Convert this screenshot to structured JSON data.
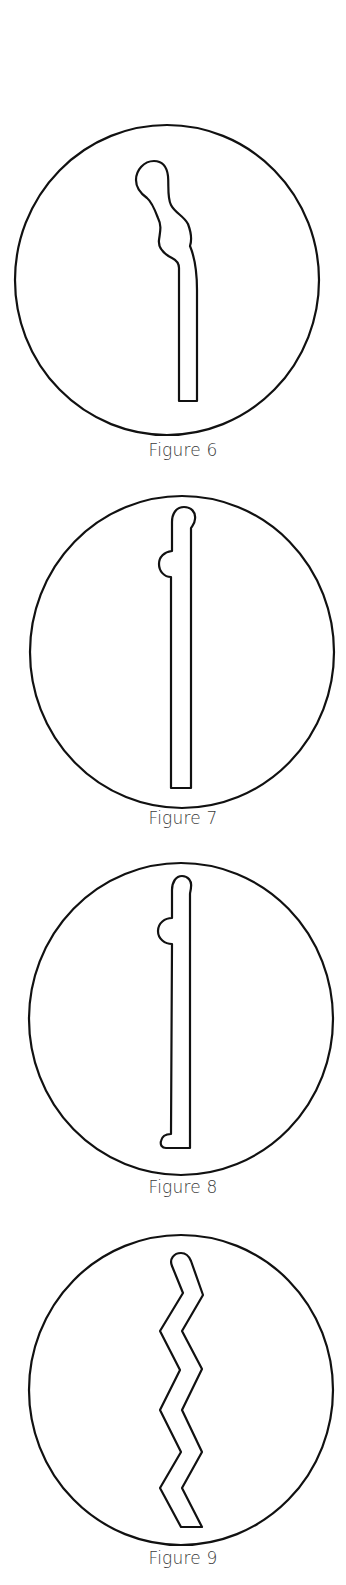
{
  "figures": [
    {
      "id": "figure-6",
      "caption": "Figure 6",
      "shape": "curved stem with bulbous wavy head",
      "circle": {
        "cx": 167,
        "cy": 280,
        "rx": 153,
        "ry": 155
      },
      "caption_y": 443
    },
    {
      "id": "figure-7",
      "caption": "Figure 7",
      "shape": "straight stem with rounded head and side knob",
      "circle": {
        "cx": 182,
        "cy": 652,
        "rx": 152,
        "ry": 156
      },
      "caption_y": 811
    },
    {
      "id": "figure-8",
      "caption": "Figure 8",
      "shape": "straight stem with rounded head, side knob and rounded foot",
      "circle": {
        "cx": 181,
        "cy": 1019,
        "rx": 152,
        "ry": 156
      },
      "caption_y": 1180
    },
    {
      "id": "figure-9",
      "caption": "Figure 9",
      "shape": "zigzag stem with rounded top",
      "circle": {
        "cx": 181,
        "cy": 1390,
        "rx": 152,
        "ry": 155
      },
      "caption_y": 1550
    }
  ],
  "colors": {
    "stroke": "#111111",
    "caption": "#3a3a3a",
    "background": "#ffffff"
  }
}
